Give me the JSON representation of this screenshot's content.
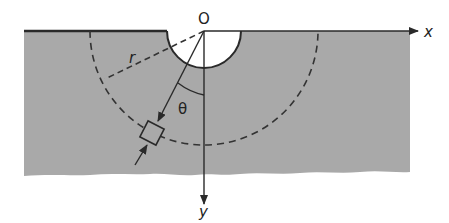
{
  "diagram": {
    "type": "half-space with semicircular hole, polar coordinates",
    "labels": {
      "origin": "O",
      "x_axis": "x",
      "y_axis": "y",
      "radius": "r",
      "angle": "θ"
    },
    "colors": {
      "material_fill": "#a9a9a9",
      "lines": "#2a2a2a",
      "background": "#ffffff"
    },
    "elements": [
      "free surface along x-axis",
      "semicircular hole centered at O",
      "dashed circular arc of radius r",
      "radial line at angle θ from y-axis",
      "stress element (square) on radial line",
      "arrows indicating radial direction"
    ]
  }
}
